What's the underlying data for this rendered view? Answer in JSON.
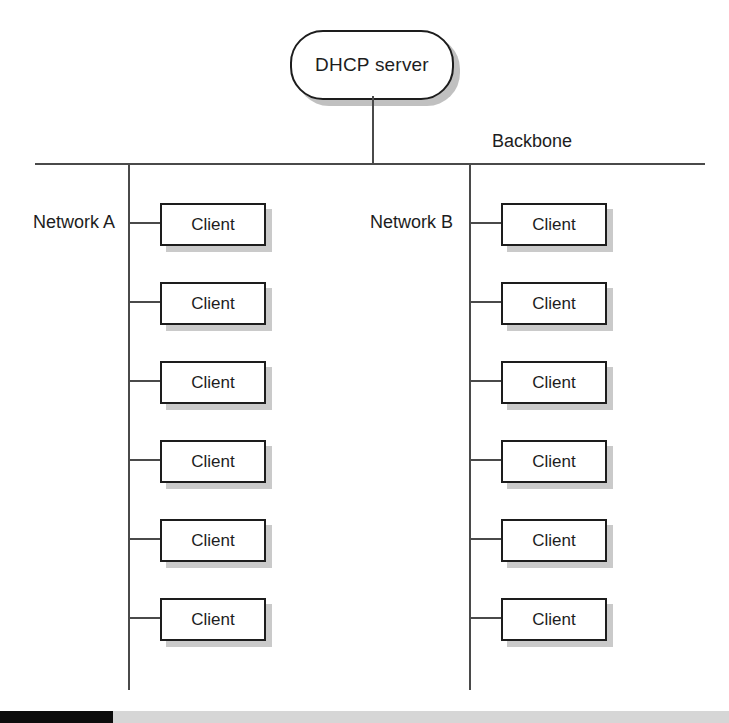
{
  "diagram": {
    "server": {
      "label": "DHCP server",
      "shape": "rounded-rectangle",
      "x": 290,
      "y": 30,
      "width": 160,
      "height": 66
    },
    "backbone": {
      "label": "Backbone",
      "y": 163,
      "x_start": 35,
      "x_end": 705
    },
    "uplink": {
      "from": "DHCP server",
      "to": "Backbone",
      "x": 372,
      "y_start": 96,
      "y_end": 163
    },
    "networks": [
      {
        "label": "Network A",
        "trunk_x": 128,
        "trunk_y_start": 163,
        "trunk_y_end": 690,
        "label_x": 33,
        "label_y": 212,
        "box_x": 160,
        "clients": [
          {
            "label": "Client",
            "y": 203
          },
          {
            "label": "Client",
            "y": 282
          },
          {
            "label": "Client",
            "y": 361
          },
          {
            "label": "Client",
            "y": 440
          },
          {
            "label": "Client",
            "y": 519
          },
          {
            "label": "Client",
            "y": 598
          }
        ]
      },
      {
        "label": "Network B",
        "trunk_x": 469,
        "trunk_y_start": 163,
        "trunk_y_end": 690,
        "label_x": 370,
        "label_y": 212,
        "box_x": 501,
        "clients": [
          {
            "label": "Client",
            "y": 203
          },
          {
            "label": "Client",
            "y": 282
          },
          {
            "label": "Client",
            "y": 361
          },
          {
            "label": "Client",
            "y": 440
          },
          {
            "label": "Client",
            "y": 519
          },
          {
            "label": "Client",
            "y": 598
          }
        ]
      }
    ],
    "colors": {
      "line": "#4a4a4a",
      "border": "#1d1d1d",
      "text": "#1d1d1d",
      "background": "#ffffff",
      "shadow": "#8c8c8c",
      "footer_dark": "#0c0c0c",
      "footer_light": "#d6d6d6"
    }
  }
}
